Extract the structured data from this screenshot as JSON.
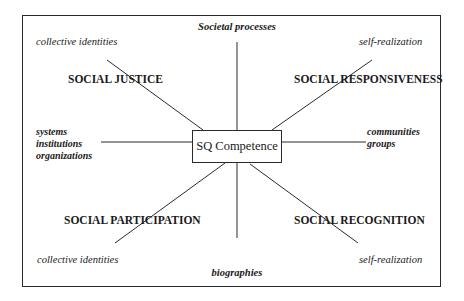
{
  "diagram": {
    "center": "SQ Competence",
    "top": "Societal processes",
    "bottom": "biographies",
    "left": [
      "systems",
      "institutions",
      "organizations"
    ],
    "right": [
      "communities",
      "groups"
    ],
    "quadrants": {
      "upper_left": {
        "title": "SOCIAL JUSTICE",
        "pole": "collective identities"
      },
      "upper_right": {
        "title": "SOCIAL RESPONSIVENESS",
        "pole": "self-realization"
      },
      "lower_left": {
        "title": "SOCIAL PARTICIPATION",
        "pole": "collective identities"
      },
      "lower_right": {
        "title": "SOCIAL RECOGNITION",
        "pole": "self-realization"
      }
    }
  }
}
